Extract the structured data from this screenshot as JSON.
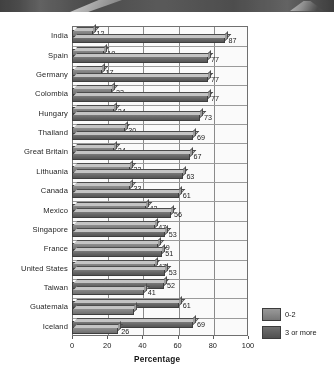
{
  "chart_data": {
    "type": "bar",
    "orientation": "horizontal",
    "title": "",
    "xlabel": "Percentage",
    "ylabel": "",
    "xlim": [
      0,
      100
    ],
    "xticks": [
      0,
      20,
      40,
      60,
      80,
      100
    ],
    "grid": true,
    "legend_position": "right-bottom",
    "categories": [
      "India",
      "Spain",
      "Germany",
      "Colombia",
      "Hungary",
      "Thailand",
      "Great Britain",
      "Lithuania",
      "Canada",
      "Mexico",
      "Singapore",
      "France",
      "United States",
      "Taiwan",
      "Guatemala",
      "Iceland"
    ],
    "series": [
      {
        "name": "0-2",
        "values": [
          12,
          18,
          17,
          23,
          24,
          30,
          24,
          33,
          33,
          42,
          47,
          49,
          47,
          41,
          35,
          26
        ]
      },
      {
        "name": "3 or more",
        "values": [
          87,
          77,
          77,
          77,
          73,
          69,
          67,
          63,
          61,
          56,
          53,
          51,
          53,
          52,
          61,
          69
        ]
      }
    ],
    "rows": [
      {
        "category": "India",
        "top": {
          "series": "0-2",
          "value": 12,
          "label": "12"
        },
        "bottom": {
          "series": "3 or more",
          "value": 87,
          "label": "87"
        }
      },
      {
        "category": "Spain",
        "top": {
          "series": "0-2",
          "value": 18,
          "label": "18"
        },
        "bottom": {
          "series": "3 or more",
          "value": 77,
          "label": "77"
        }
      },
      {
        "category": "Germany",
        "top": {
          "series": "0-2",
          "value": 17,
          "label": "17"
        },
        "bottom": {
          "series": "3 or more",
          "value": 77,
          "label": "77"
        }
      },
      {
        "category": "Colombia",
        "top": {
          "series": "0-2",
          "value": 23,
          "label": "23"
        },
        "bottom": {
          "series": "3 or more",
          "value": 77,
          "label": "77"
        }
      },
      {
        "category": "Hungary",
        "top": {
          "series": "0-2",
          "value": 24,
          "label": "24"
        },
        "bottom": {
          "series": "3 or more",
          "value": 73,
          "label": "73"
        }
      },
      {
        "category": "Thailand",
        "top": {
          "series": "0-2",
          "value": 30,
          "label": "30"
        },
        "bottom": {
          "series": "3 or more",
          "value": 69,
          "label": "69"
        }
      },
      {
        "category": "Great Britain",
        "top": {
          "series": "0-2",
          "value": 24,
          "label": "24"
        },
        "bottom": {
          "series": "3 or more",
          "value": 67,
          "label": "67"
        }
      },
      {
        "category": "Lithuania",
        "top": {
          "series": "0-2",
          "value": 33,
          "label": "33"
        },
        "bottom": {
          "series": "3 or more",
          "value": 63,
          "label": "63"
        }
      },
      {
        "category": "Canada",
        "top": {
          "series": "0-2",
          "value": 33,
          "label": "33"
        },
        "bottom": {
          "series": "3 or more",
          "value": 61,
          "label": "61"
        }
      },
      {
        "category": "Mexico",
        "top": {
          "series": "0-2",
          "value": 42,
          "label": "42"
        },
        "bottom": {
          "series": "3 or more",
          "value": 56,
          "label": "56"
        }
      },
      {
        "category": "Singapore",
        "top": {
          "series": "0-2",
          "value": 47,
          "label": "47"
        },
        "bottom": {
          "series": "3 or more",
          "value": 53,
          "label": "53"
        }
      },
      {
        "category": "France",
        "top": {
          "series": "0-2",
          "value": 49,
          "label": "49"
        },
        "bottom": {
          "series": "3 or more",
          "value": 51,
          "label": "51"
        }
      },
      {
        "category": "United States",
        "top": {
          "series": "0-2",
          "value": 47,
          "label": "47"
        },
        "bottom": {
          "series": "3 or more",
          "value": 53,
          "label": "53"
        }
      },
      {
        "category": "Taiwan",
        "top": {
          "series": "3 or more",
          "value": 52,
          "label": "52"
        },
        "bottom": {
          "series": "0-2",
          "value": 41,
          "label": "41"
        }
      },
      {
        "category": "Guatemala",
        "top": {
          "series": "3 or more",
          "value": 61,
          "label": "61"
        },
        "bottom": {
          "series": "0-2",
          "value": 35,
          "label": ""
        }
      },
      {
        "category": "Iceland",
        "top": {
          "series": "3 or more",
          "value": 69,
          "label": "69"
        },
        "bottom": {
          "series": "0-2",
          "value": 26,
          "label": "26"
        }
      }
    ],
    "legend": [
      {
        "name": "0-2",
        "color": "#7d7d7d"
      },
      {
        "name": "3 or more",
        "color": "#5a5a5a"
      }
    ]
  }
}
